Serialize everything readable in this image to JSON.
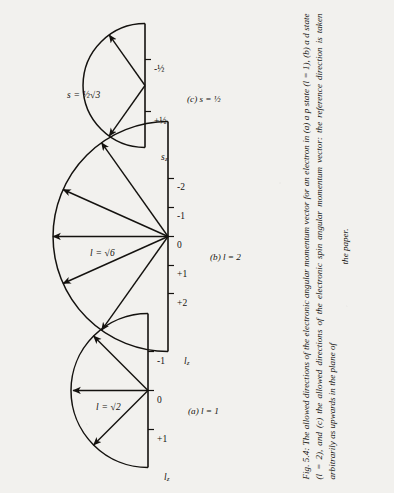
{
  "figure": {
    "caption_lines": [
      "Fig. 5.4: The allowed directions of the electronic angular momentum vector for an electron in",
      "(a) a p state (l = 1), (b) a d state (l = 2), and (c) the allowed directions of the electronic spin angular",
      "momentum vector: the reference direction is taken arbitrarily as upwards in the plane of",
      "the paper."
    ],
    "caption_full": "Fig. 5.4: The allowed directions of the electronic angular momentum vector for an electron in (a) a p state (l = 1), (b) a d state (l = 2), and (c) the allowed directions of the electronic spin angular momentum vector: the reference direction is taken arbitrarily as upwards in the plane of the paper."
  },
  "panels": [
    {
      "id": "a",
      "sublabel": "(a)  l = 1",
      "axis_label": "l",
      "axis_subscript": "z",
      "magnitude_symbol": "l",
      "magnitude_value": "√2",
      "magnitude_label": "l = √2",
      "ticks": [
        "+1",
        "0",
        "-1"
      ],
      "vector_m_values": [
        1,
        0,
        -1
      ],
      "vector_count": 3
    },
    {
      "id": "b",
      "sublabel": "(b)  l = 2",
      "axis_label": "l",
      "axis_subscript": "z",
      "magnitude_symbol": "l",
      "magnitude_value": "√6",
      "magnitude_label": "l = √6",
      "ticks": [
        "+2",
        "+1",
        "0",
        "-1",
        "-2"
      ],
      "vector_m_values": [
        2,
        1,
        0,
        -1,
        -2
      ],
      "vector_count": 5
    },
    {
      "id": "c",
      "sublabel": "(c)  s = ½",
      "axis_label": "s",
      "axis_subscript": "z",
      "magnitude_symbol": "s",
      "magnitude_value": "½√3",
      "magnitude_label": "s = ½√3",
      "ticks": [
        "+½",
        "-½"
      ],
      "vector_m_values": [
        0.5,
        -0.5
      ],
      "vector_count": 2
    }
  ],
  "colors": {
    "ink": "#14120f",
    "paper": "#f2f1ee"
  }
}
